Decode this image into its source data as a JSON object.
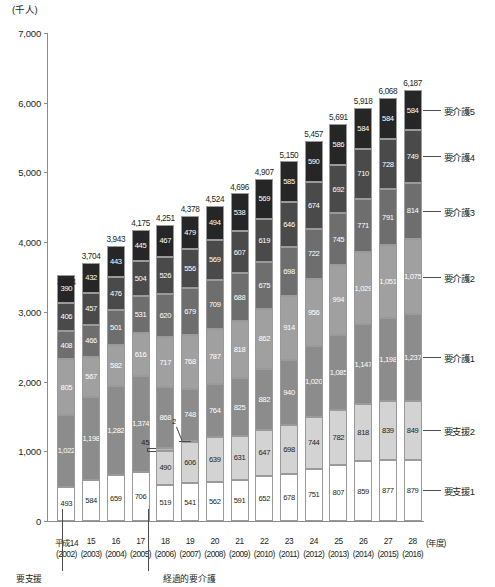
{
  "axis": {
    "unit": "(千人)",
    "y_ticks": [
      "7,000",
      "6,000",
      "5,000",
      "4,000",
      "3,000",
      "2,000",
      "1,000",
      "0"
    ],
    "y_min": 0,
    "y_max": 7000,
    "x_unit": "(年度)"
  },
  "legend": [
    {
      "key": "yokaigo5",
      "label": "要介護5"
    },
    {
      "key": "yokaigo4",
      "label": "要介護4"
    },
    {
      "key": "yokaigo3",
      "label": "要介護3"
    },
    {
      "key": "yokaigo2",
      "label": "要介護2"
    },
    {
      "key": "yokaigo1",
      "label": "要介護1"
    },
    {
      "key": "yoshien2",
      "label": "要支援2"
    },
    {
      "key": "yoshien1",
      "label": "要支援1"
    }
  ],
  "annotations": {
    "yoshien_note": "要支援",
    "keikateki_note": "経過的要介護",
    "keikateki_2006": "45",
    "keikateki_2007": "2"
  },
  "chart_data": {
    "type": "bar",
    "stacked": true,
    "title": "",
    "xlabel": "(年度)",
    "ylabel": "(千人)",
    "ylim": [
      0,
      7000
    ],
    "grid": false,
    "legend_position": "right",
    "categories": [
      "平成14",
      "15",
      "16",
      "17",
      "18",
      "19",
      "20",
      "21",
      "22",
      "23",
      "24",
      "25",
      "26",
      "27",
      "28"
    ],
    "category_years": [
      "(2002)",
      "(2003)",
      "(2004)",
      "(2005)",
      "(2006)",
      "(2007)",
      "(2008)",
      "(2009)",
      "(2010)",
      "(2011)",
      "(2012)",
      "(2013)",
      "(2014)",
      "(2015)",
      "(2016)"
    ],
    "series": [
      {
        "name": "要支援1",
        "values": [
          493,
          584,
          659,
          706,
          519,
          541,
          562,
          591,
          652,
          678,
          751,
          807,
          859,
          877,
          879
        ]
      },
      {
        "name": "要支援2",
        "values": [
          null,
          null,
          null,
          null,
          490,
          606,
          639,
          631,
          647,
          698,
          744,
          782,
          818,
          839,
          849
        ]
      },
      {
        "name": "経過的要介護",
        "values": [
          null,
          null,
          null,
          null,
          45,
          2,
          null,
          null,
          null,
          null,
          null,
          null,
          null,
          null,
          null
        ]
      },
      {
        "name": "要介護1",
        "values": [
          1022,
          1198,
          1282,
          1374,
          868,
          748,
          764,
          825,
          882,
          940,
          1020,
          1085,
          1147,
          1198,
          1237
        ]
      },
      {
        "name": "要介護2",
        "values": [
          805,
          567,
          582,
          616,
          717,
          768,
          787,
          818,
          862,
          914,
          956,
          994,
          1029,
          1051,
          1075
        ]
      },
      {
        "name": "要介護3",
        "values": [
          408,
          466,
          501,
          531,
          620,
          679,
          709,
          688,
          675,
          698,
          722,
          745,
          771,
          791,
          814
        ]
      },
      {
        "name": "要介護4",
        "values": [
          406,
          457,
          476,
          504,
          526,
          556,
          569,
          607,
          619,
          646,
          674,
          692,
          710,
          728,
          749
        ]
      },
      {
        "name": "要介護5",
        "values": [
          390,
          432,
          443,
          445,
          467,
          479,
          494,
          538,
          569,
          585,
          590,
          586,
          584,
          584,
          584
        ]
      }
    ],
    "totals": [
      3324,
      3704,
      3943,
      4175,
      4251,
      4378,
      4524,
      4696,
      4907,
      5150,
      5457,
      5691,
      5918,
      6068,
      6187
    ],
    "total_labels": [
      "3,324",
      "3,704",
      "3,943",
      "4,175",
      "4,251",
      "4,378",
      "4,524",
      "4,696",
      "4,907",
      "5,150",
      "5,457",
      "5,691",
      "5,918",
      "6,068",
      "6,187"
    ],
    "colors": {
      "要支援1": "#ffffff",
      "要支援2": "#d3d3d3",
      "経過的要介護": "#b5b5b5",
      "要介護1": "#8c8c8c",
      "要介護2": "#a0a0a0",
      "要介護3": "#6e6e6e",
      "要介護4": "#4a4a4a",
      "要介護5": "#262626"
    }
  }
}
